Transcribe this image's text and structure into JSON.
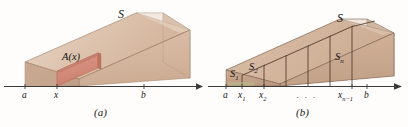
{
  "figure": {
    "kind": "calculus-volume-cross-section-figure",
    "panels": [
      {
        "id": "a",
        "caption": "(a)",
        "solid_label": "S",
        "cross_section_label": "A(x)",
        "axis_ticks": [
          "a",
          "x",
          "b"
        ],
        "colors": {
          "solid_light": "#e0cab8",
          "solid_mid": "#d1b29c",
          "solid_dark": "#c2a189",
          "cross_section": "#d8907f",
          "cross_section_dark": "#c9806f",
          "outline": "#8f6f58",
          "axis": "#3a3a3a"
        }
      },
      {
        "id": "b",
        "caption": "(b)",
        "solid_label": "S",
        "slab_labels": [
          "S1",
          "S2",
          "Sn"
        ],
        "slab_label_text": {
          "s1_base": "S",
          "s1_sub": "1",
          "s2_base": "S",
          "s2_sub": "2",
          "sn_base": "S",
          "sn_sub": "n"
        },
        "ellipsis": "· · ·",
        "axis_ticks": [
          "a",
          "x1",
          "x2",
          "xn-1",
          "b"
        ],
        "axis_tick_text": {
          "a": "a",
          "x1_base": "x",
          "x1_sub": "1",
          "x2_base": "x",
          "x2_sub": "2",
          "xn1_base": "x",
          "xn1_sub": "n−1",
          "b": "b"
        },
        "colors": {
          "slab_face": "#c7a58c",
          "slab_face_alt": "#cfae96",
          "slab_top": "#d8bda7",
          "slab_dark": "#b8937a",
          "outline": "#4a3527",
          "axis": "#3a3a3a",
          "green_tint": "#b9c08d"
        }
      }
    ],
    "background": "#fefdfc"
  }
}
